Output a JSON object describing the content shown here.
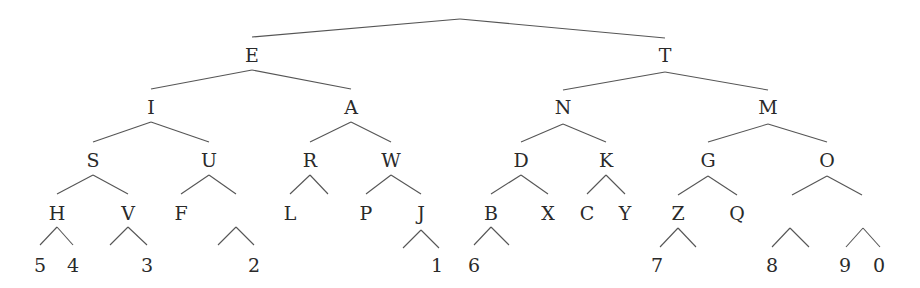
{
  "colors": {
    "text": "#2a2a2a",
    "line": "#555555",
    "background": "#ffffff"
  },
  "nodes": [
    {
      "id": "E",
      "label": "E",
      "x": 252,
      "y": 55
    },
    {
      "id": "T",
      "label": "T",
      "x": 665,
      "y": 55
    },
    {
      "id": "I",
      "label": "I",
      "x": 151,
      "y": 107
    },
    {
      "id": "A",
      "label": "A",
      "x": 351,
      "y": 107
    },
    {
      "id": "N",
      "label": "N",
      "x": 563,
      "y": 107
    },
    {
      "id": "M",
      "label": "M",
      "x": 768,
      "y": 107
    },
    {
      "id": "S",
      "label": "S",
      "x": 93,
      "y": 160
    },
    {
      "id": "U",
      "label": "U",
      "x": 209,
      "y": 160
    },
    {
      "id": "R",
      "label": "R",
      "x": 310,
      "y": 160
    },
    {
      "id": "W",
      "label": "W",
      "x": 391,
      "y": 160
    },
    {
      "id": "D",
      "label": "D",
      "x": 521,
      "y": 160
    },
    {
      "id": "K",
      "label": "K",
      "x": 606,
      "y": 160
    },
    {
      "id": "G",
      "label": "G",
      "x": 708,
      "y": 160
    },
    {
      "id": "O",
      "label": "O",
      "x": 827,
      "y": 160
    },
    {
      "id": "H",
      "label": "H",
      "x": 57,
      "y": 213
    },
    {
      "id": "V",
      "label": "V",
      "x": 128,
      "y": 213
    },
    {
      "id": "F",
      "label": "F",
      "x": 181,
      "y": 213
    },
    {
      "id": "L",
      "label": "L",
      "x": 290,
      "y": 213
    },
    {
      "id": "P",
      "label": "P",
      "x": 366,
      "y": 213
    },
    {
      "id": "J",
      "label": "J",
      "x": 421,
      "y": 213
    },
    {
      "id": "B",
      "label": "B",
      "x": 491,
      "y": 213
    },
    {
      "id": "X",
      "label": "X",
      "x": 548,
      "y": 213
    },
    {
      "id": "C",
      "label": "C",
      "x": 587,
      "y": 213
    },
    {
      "id": "Y",
      "label": "Y",
      "x": 625,
      "y": 213
    },
    {
      "id": "Z",
      "label": "Z",
      "x": 678,
      "y": 213
    },
    {
      "id": "Q",
      "label": "Q",
      "x": 737,
      "y": 213
    },
    {
      "id": "d5",
      "label": "5",
      "x": 40,
      "y": 265
    },
    {
      "id": "d4",
      "label": "4",
      "x": 73,
      "y": 265
    },
    {
      "id": "d3",
      "label": "3",
      "x": 147,
      "y": 265
    },
    {
      "id": "d2",
      "label": "2",
      "x": 254,
      "y": 265
    },
    {
      "id": "d1",
      "label": "1",
      "x": 437,
      "y": 265
    },
    {
      "id": "d6",
      "label": "6",
      "x": 474,
      "y": 265
    },
    {
      "id": "d7",
      "label": "7",
      "x": 657,
      "y": 265
    },
    {
      "id": "d8",
      "label": "8",
      "x": 772,
      "y": 265
    },
    {
      "id": "d9",
      "label": "9",
      "x": 845,
      "y": 265
    },
    {
      "id": "d0",
      "label": "0",
      "x": 879,
      "y": 265
    }
  ],
  "edges": [
    [
      460,
      19,
      252,
      37
    ],
    [
      460,
      19,
      665,
      38
    ],
    [
      252,
      70,
      151,
      89
    ],
    [
      252,
      70,
      351,
      89
    ],
    [
      665,
      72,
      563,
      90
    ],
    [
      665,
      72,
      768,
      90
    ],
    [
      151,
      122,
      93,
      142
    ],
    [
      151,
      122,
      209,
      142
    ],
    [
      351,
      122,
      310,
      142
    ],
    [
      351,
      122,
      391,
      142
    ],
    [
      563,
      124,
      521,
      142
    ],
    [
      563,
      124,
      606,
      142
    ],
    [
      768,
      124,
      708,
      142
    ],
    [
      768,
      124,
      827,
      142
    ],
    [
      93,
      175,
      57,
      194
    ],
    [
      93,
      175,
      128,
      194
    ],
    [
      209,
      175,
      181,
      194
    ],
    [
      209,
      175,
      236,
      194
    ],
    [
      310,
      175,
      290,
      194
    ],
    [
      310,
      175,
      328,
      194
    ],
    [
      391,
      175,
      366,
      194
    ],
    [
      391,
      175,
      421,
      194
    ],
    [
      521,
      175,
      491,
      194
    ],
    [
      521,
      175,
      548,
      194
    ],
    [
      606,
      175,
      587,
      194
    ],
    [
      606,
      175,
      625,
      194
    ],
    [
      708,
      176,
      678,
      195
    ],
    [
      708,
      176,
      737,
      195
    ],
    [
      827,
      176,
      792,
      195
    ],
    [
      827,
      176,
      862,
      195
    ],
    [
      57,
      227,
      40,
      245
    ],
    [
      57,
      227,
      73,
      245
    ],
    [
      128,
      227,
      110,
      245
    ],
    [
      128,
      227,
      147,
      245
    ],
    [
      236,
      227,
      218,
      245
    ],
    [
      236,
      227,
      254,
      245
    ],
    [
      421,
      230,
      403,
      248
    ],
    [
      421,
      230,
      439,
      248
    ],
    [
      491,
      227,
      474,
      245
    ],
    [
      491,
      227,
      509,
      245
    ],
    [
      678,
      228,
      660,
      247
    ],
    [
      678,
      228,
      696,
      247
    ],
    [
      790,
      228,
      772,
      247
    ],
    [
      790,
      228,
      809,
      247
    ],
    [
      863,
      228,
      846,
      247
    ],
    [
      863,
      228,
      880,
      247
    ]
  ]
}
